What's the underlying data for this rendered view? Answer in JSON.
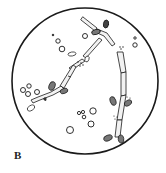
{
  "figure": {
    "panel_label": "B",
    "colors": {
      "ink": "#1a1a1a",
      "hypha_fill": "#f2f2f2",
      "spore_fill": "#777777",
      "background": "#ffffff"
    }
  }
}
